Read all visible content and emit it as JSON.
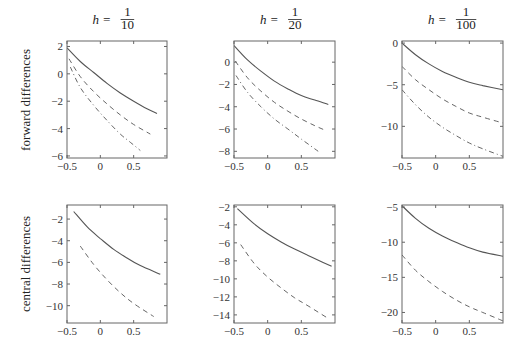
{
  "chart_data": [
    {
      "type": "line",
      "row": "forward differences",
      "title": "h = 1/10",
      "title_parts": {
        "var": "h",
        "num": "1",
        "den": "10"
      },
      "xlim": [
        -0.5,
        1.0
      ],
      "ylim": [
        -6.15,
        2.4
      ],
      "xticks": [
        -0.5,
        0,
        0.5
      ],
      "xtick_labels": [
        "−0.5",
        "0",
        "0.5"
      ],
      "yticks": [
        2,
        0,
        -2,
        -4,
        -6
      ],
      "ytick_labels": [
        "2",
        "0",
        "−2",
        "−4",
        "−6"
      ],
      "series": [
        {
          "name": "solid",
          "style": "solid",
          "x": [
            -0.5,
            -0.3,
            -0.1,
            0.1,
            0.3,
            0.5,
            0.7,
            0.85
          ],
          "y": [
            1.9,
            0.9,
            0.1,
            -0.7,
            -1.4,
            -2.0,
            -2.55,
            -2.9
          ]
        },
        {
          "name": "dashed",
          "style": "dashed",
          "x": [
            -0.47,
            -0.3,
            -0.1,
            0.1,
            0.3,
            0.5,
            0.75
          ],
          "y": [
            1.1,
            -0.2,
            -1.3,
            -2.2,
            -3.0,
            -3.7,
            -4.4
          ]
        },
        {
          "name": "dashdot",
          "style": "dashdot",
          "x": [
            -0.45,
            -0.3,
            -0.1,
            0.1,
            0.3,
            0.45,
            0.6
          ],
          "y": [
            0.5,
            -1.0,
            -2.3,
            -3.4,
            -4.4,
            -5.0,
            -5.6
          ]
        }
      ]
    },
    {
      "type": "line",
      "row": "forward differences",
      "title": "h = 1/20",
      "title_parts": {
        "var": "h",
        "num": "1",
        "den": "20"
      },
      "xlim": [
        -0.5,
        1.0
      ],
      "ylim": [
        -8.6,
        1.9
      ],
      "xticks": [
        -0.5,
        0,
        0.5
      ],
      "xtick_labels": [
        "−0.5",
        "0",
        "0.5"
      ],
      "yticks": [
        0,
        -2,
        -4,
        -6,
        -8
      ],
      "ytick_labels": [
        "0",
        "−2",
        "−4",
        "−6",
        "−8"
      ],
      "series": [
        {
          "name": "solid",
          "style": "solid",
          "x": [
            -0.5,
            -0.3,
            -0.1,
            0.1,
            0.3,
            0.5,
            0.7,
            0.9
          ],
          "y": [
            1.5,
            0.2,
            -0.8,
            -1.7,
            -2.4,
            -3.0,
            -3.4,
            -3.8
          ]
        },
        {
          "name": "dashed",
          "style": "dashed",
          "x": [
            -0.48,
            -0.3,
            -0.1,
            0.1,
            0.3,
            0.5,
            0.7,
            0.85
          ],
          "y": [
            0.1,
            -1.4,
            -2.6,
            -3.6,
            -4.4,
            -5.1,
            -5.7,
            -6.1
          ]
        },
        {
          "name": "dashdot",
          "style": "dashdot",
          "x": [
            -0.47,
            -0.3,
            -0.1,
            0.1,
            0.3,
            0.5,
            0.75
          ],
          "y": [
            -1.2,
            -2.7,
            -4.0,
            -5.1,
            -6.0,
            -6.9,
            -8.0
          ]
        }
      ]
    },
    {
      "type": "line",
      "row": "forward differences",
      "title": "h = 1/100",
      "title_parts": {
        "var": "h",
        "num": "1",
        "den": "100"
      },
      "xlim": [
        -0.5,
        1.0
      ],
      "ylim": [
        -13.8,
        0.25
      ],
      "xticks": [
        -0.5,
        0,
        0.5
      ],
      "xtick_labels": [
        "−0.5",
        "0",
        "0.5"
      ],
      "yticks": [
        0,
        -5,
        -10
      ],
      "ytick_labels": [
        "0",
        "−5",
        "−10"
      ],
      "series": [
        {
          "name": "solid",
          "style": "solid",
          "x": [
            -0.5,
            -0.3,
            -0.1,
            0.1,
            0.3,
            0.5,
            0.7,
            1.0
          ],
          "y": [
            0.0,
            -1.4,
            -2.5,
            -3.4,
            -4.1,
            -4.7,
            -5.1,
            -5.6
          ]
        },
        {
          "name": "dashed",
          "style": "dashed",
          "x": [
            -0.5,
            -0.3,
            -0.1,
            0.1,
            0.3,
            0.5,
            0.7,
            1.0
          ],
          "y": [
            -2.8,
            -4.4,
            -5.6,
            -6.7,
            -7.6,
            -8.4,
            -8.9,
            -9.6
          ]
        },
        {
          "name": "dashdot",
          "style": "dashdot",
          "x": [
            -0.5,
            -0.3,
            -0.1,
            0.1,
            0.3,
            0.5,
            0.7,
            1.0
          ],
          "y": [
            -5.6,
            -7.4,
            -8.9,
            -10.1,
            -11.1,
            -12.0,
            -12.7,
            -13.6
          ]
        }
      ]
    },
    {
      "type": "line",
      "row": "central differences",
      "title": "",
      "xlim": [
        -0.5,
        1.0
      ],
      "ylim": [
        -11.6,
        -0.7
      ],
      "xticks": [
        -0.5,
        0,
        0.5
      ],
      "xtick_labels": [
        "−0.5",
        "0",
        "0.5"
      ],
      "yticks": [
        -2,
        -4,
        -6,
        -8,
        -10
      ],
      "ytick_labels": [
        "−2",
        "−4",
        "−6",
        "−8",
        "−10"
      ],
      "series": [
        {
          "name": "solid",
          "style": "solid",
          "x": [
            -0.4,
            -0.2,
            0.0,
            0.2,
            0.4,
            0.6,
            0.9
          ],
          "y": [
            -1.3,
            -2.7,
            -3.8,
            -4.8,
            -5.6,
            -6.3,
            -7.1
          ]
        },
        {
          "name": "dashed",
          "style": "dashed",
          "x": [
            -0.3,
            -0.1,
            0.1,
            0.3,
            0.5,
            0.8
          ],
          "y": [
            -4.5,
            -6.2,
            -7.6,
            -8.8,
            -9.8,
            -11.0
          ]
        }
      ]
    },
    {
      "type": "line",
      "row": "central differences",
      "title": "",
      "xlim": [
        -0.5,
        1.0
      ],
      "ylim": [
        -14.9,
        -1.8
      ],
      "xticks": [
        -0.5,
        0,
        0.5
      ],
      "xtick_labels": [
        "−0.5",
        "0",
        "0.5"
      ],
      "yticks": [
        -2,
        -4,
        -6,
        -8,
        -10,
        -12,
        -14
      ],
      "ytick_labels": [
        "−2",
        "−4",
        "−6",
        "−8",
        "−10",
        "−12",
        "−14"
      ],
      "series": [
        {
          "name": "solid",
          "style": "solid",
          "x": [
            -0.45,
            -0.2,
            0.0,
            0.2,
            0.4,
            0.6,
            0.8,
            0.95
          ],
          "y": [
            -2.2,
            -3.9,
            -5.0,
            -5.9,
            -6.7,
            -7.4,
            -8.1,
            -8.6
          ]
        },
        {
          "name": "dashed",
          "style": "dashed",
          "x": [
            -0.4,
            -0.2,
            0.0,
            0.2,
            0.4,
            0.6,
            0.9
          ],
          "y": [
            -6.2,
            -8.3,
            -9.8,
            -11.0,
            -12.1,
            -13.0,
            -14.4
          ]
        }
      ]
    },
    {
      "type": "line",
      "row": "central differences",
      "title": "",
      "xlim": [
        -0.5,
        1.0
      ],
      "ylim": [
        -21.5,
        -4.7
      ],
      "xticks": [
        -0.5,
        0,
        0.5
      ],
      "xtick_labels": [
        "−0.5",
        "0",
        "0.5"
      ],
      "yticks": [
        -5,
        -10,
        -15,
        -20
      ],
      "ytick_labels": [
        "−5",
        "−10",
        "−15",
        "−20"
      ],
      "series": [
        {
          "name": "solid",
          "style": "solid",
          "x": [
            -0.5,
            -0.3,
            -0.1,
            0.1,
            0.3,
            0.5,
            0.7,
            1.0
          ],
          "y": [
            -4.8,
            -6.6,
            -8.0,
            -9.1,
            -10.0,
            -10.8,
            -11.4,
            -12.0
          ]
        },
        {
          "name": "dashed",
          "style": "dashed",
          "x": [
            -0.5,
            -0.3,
            -0.1,
            0.1,
            0.3,
            0.5,
            0.7,
            1.0
          ],
          "y": [
            -11.8,
            -14.0,
            -15.6,
            -17.0,
            -18.2,
            -19.2,
            -20.0,
            -21.2
          ]
        }
      ]
    }
  ],
  "row_labels": [
    "forward differences",
    "central differences"
  ],
  "colors": {
    "line": "#555555",
    "axis": "#666666",
    "text": "#222222"
  }
}
